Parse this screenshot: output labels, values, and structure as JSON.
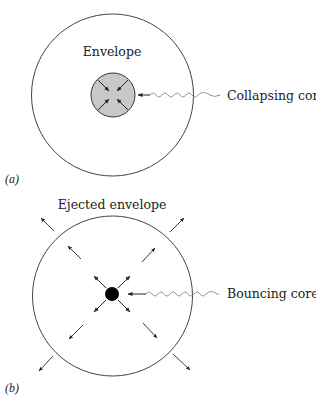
{
  "panels": [
    {
      "id": "a",
      "panel_label": "(a)",
      "envelope_label": "Envelope",
      "core_label": "Collapsing core",
      "core_state": "collapsing",
      "core_fill": "#c8c8c8",
      "arrow_direction": "inward"
    },
    {
      "id": "b",
      "panel_label": "(b)",
      "envelope_label": "Ejected envelope",
      "core_label": "Bouncing core",
      "core_state": "bouncing",
      "core_fill": "#000000",
      "arrow_direction": "outward"
    }
  ],
  "colors": {
    "stroke": "#333333",
    "wavy": "#888888",
    "text": "#222222"
  }
}
